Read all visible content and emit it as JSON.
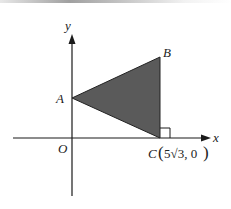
{
  "figure": {
    "axes": {
      "x_label": "x",
      "y_label": "y",
      "origin_label": "O"
    },
    "points": {
      "A": {
        "label": "A"
      },
      "B": {
        "label": "B"
      },
      "C": {
        "label": "C",
        "coord_open": "(",
        "coord_value": "5√3, 0",
        "coord_close": ")"
      }
    },
    "triangle": {
      "vertices": [
        "A",
        "B",
        "C"
      ],
      "fill": "#5a5a5a",
      "stroke": "#222222"
    },
    "right_angle_marker": {
      "at": "C"
    },
    "colors": {
      "axis": "#1a1a1a",
      "fill": "#5a5a5a",
      "text": "#222222"
    }
  }
}
